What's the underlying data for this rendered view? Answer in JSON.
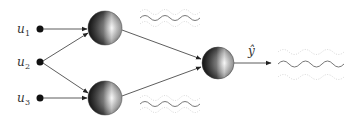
{
  "diagram": {
    "type": "neural-network",
    "inputs": [
      {
        "label": "u",
        "sub": "1"
      },
      {
        "label": "u",
        "sub": "2"
      },
      {
        "label": "u",
        "sub": "3"
      }
    ],
    "output_label": "ŷ",
    "colors": {
      "edge": "#333333",
      "node_dark": "#111111",
      "node_light": "#f2f2f2",
      "wave": "#555555",
      "wave_dotted": "#bbbbbb"
    }
  }
}
